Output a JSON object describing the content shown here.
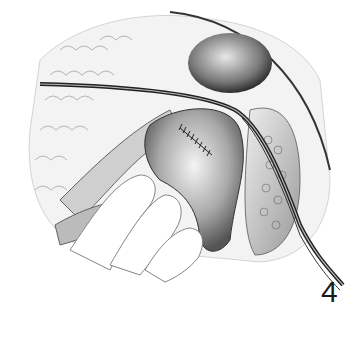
{
  "figure": {
    "number": "4",
    "style": "grayscale pencil drawing"
  }
}
